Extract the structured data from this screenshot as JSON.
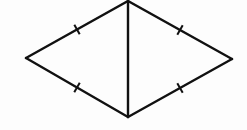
{
  "figure": {
    "stroke_color": "#111111",
    "background_color": "#fdfdfd",
    "vertices": {
      "top": [
        128,
        1
      ],
      "bottom": [
        128,
        117
      ],
      "left": [
        26,
        58
      ],
      "right": [
        232,
        59
      ]
    },
    "segments": [
      {
        "name": "top-left-side",
        "from": "top",
        "to": "left",
        "tick_marks": 1
      },
      {
        "name": "bottom-left-side",
        "from": "left",
        "to": "bottom",
        "tick_marks": 1
      },
      {
        "name": "top-right-side",
        "from": "top",
        "to": "right",
        "tick_marks": 1
      },
      {
        "name": "bottom-right-side",
        "from": "right",
        "to": "bottom",
        "tick_marks": 1
      },
      {
        "name": "vertical-diagonal",
        "from": "top",
        "to": "bottom",
        "tick_marks": 0
      }
    ],
    "labels": []
  }
}
